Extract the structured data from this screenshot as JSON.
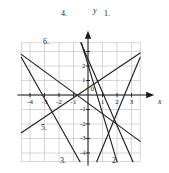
{
  "figure": {
    "type": "line-graph",
    "background": "#ffffff",
    "grid_color": "#c8c6c4",
    "axis_color": "#1a1a1a",
    "line_color": "#231f20"
  },
  "axes": {
    "x_axis_label": "x",
    "y_axis_label": "y",
    "origin_label": "0",
    "x_ticks": [
      "-4",
      "-3",
      "-2",
      "-1",
      "1",
      "2",
      "3"
    ],
    "y_ticks": [
      "3",
      "2",
      "1",
      "-1",
      "-2",
      "-3",
      "-4"
    ],
    "x_range": [
      -4.6,
      3.6
    ],
    "y_range": [
      -4.6,
      3.6
    ],
    "grid": true,
    "grid_step": 1
  },
  "curve_labels": [
    {
      "name": "label-1",
      "text": "1.",
      "x": 104,
      "y": 10
    },
    {
      "name": "label-2",
      "text": "2.",
      "x": 112,
      "y": 157
    },
    {
      "name": "label-3",
      "text": "3.",
      "x": 60,
      "y": 157
    },
    {
      "name": "label-4",
      "text": "4.",
      "x": 61,
      "y": 10
    },
    {
      "name": "label-5",
      "text": "5.",
      "x": 41,
      "y": 124
    },
    {
      "name": "label-6",
      "text": "6.",
      "x": 43,
      "y": 38
    }
  ],
  "chart_data": {
    "type": "line",
    "title": "",
    "xlabel": "x",
    "ylabel": "y",
    "xlim": [
      -4.6,
      3.6
    ],
    "ylim": [
      -4.6,
      3.6
    ],
    "grid": true,
    "legend": "inline-numbered",
    "series": [
      {
        "name": "1.",
        "points": [
          [
            -0.5,
            3.6
          ],
          [
            3.1,
            -4.6
          ]
        ],
        "slope": -2.28,
        "intercept": 2.46
      },
      {
        "name": "2.",
        "points": [
          [
            0.6,
            -4.6
          ],
          [
            3.6,
            2.6
          ]
        ],
        "slope": 2.4,
        "intercept": -6.04
      },
      {
        "name": "3.",
        "points": [
          [
            -0.55,
            -4.6
          ],
          [
            -4.6,
            2.6
          ]
        ],
        "slope": -1.78,
        "intercept": -5.58
      },
      {
        "name": "4.",
        "points": [
          [
            -0.45,
            3.6
          ],
          [
            2.0,
            -4.6
          ]
        ],
        "slope": -3.35,
        "intercept": 2.09
      },
      {
        "name": "5.",
        "points": [
          [
            -4.6,
            -2.6
          ],
          [
            3.6,
            2.9
          ]
        ],
        "slope": 0.67,
        "intercept": 0.48
      },
      {
        "name": "6.",
        "points": [
          [
            -4.6,
            2.8
          ],
          [
            3.6,
            -3.2
          ]
        ],
        "slope": -0.73,
        "intercept": -0.56
      }
    ]
  }
}
